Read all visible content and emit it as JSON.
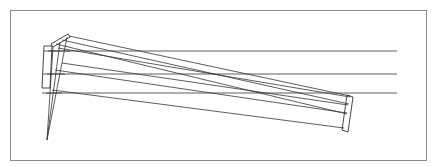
{
  "diagram": {
    "type": "optical-ray-trace",
    "frame": {
      "x": 10,
      "y": 10,
      "width": 417,
      "height": 151,
      "color": "#8a8a8a"
    },
    "line_color": "#333333",
    "focal_point": {
      "x": 47,
      "y": 140
    },
    "elements": [
      {
        "name": "left-lens-block",
        "points": [
          [
            44,
            46
          ],
          [
            52,
            46
          ],
          [
            50,
            88
          ],
          [
            42,
            88
          ]
        ]
      },
      {
        "name": "top-small-mirror",
        "points": [
          [
            50,
            45
          ],
          [
            68,
            35
          ],
          [
            70,
            38
          ],
          [
            52,
            48
          ]
        ]
      },
      {
        "name": "right-tilted-mirror",
        "points": [
          [
            347,
            95
          ],
          [
            353,
            97
          ],
          [
            348,
            131
          ],
          [
            342,
            129
          ]
        ]
      }
    ],
    "horizontal_rays": [
      {
        "y": 51,
        "x_start": 52,
        "x_end": 397
      },
      {
        "y": 74,
        "x_start": 52,
        "x_end": 397
      },
      {
        "y": 93,
        "x_start": 52,
        "x_end": 397
      }
    ]
  }
}
